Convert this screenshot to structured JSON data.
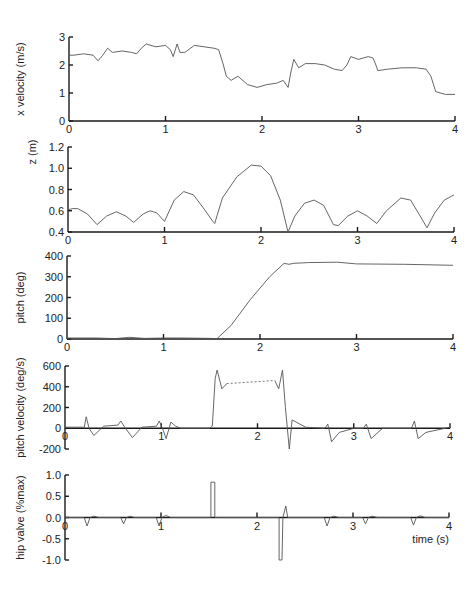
{
  "chart_data": [
    {
      "type": "line",
      "id": "xvel",
      "title": "",
      "xlabel": "",
      "ylabel": "x velocity (m/s)",
      "xlim": [
        0,
        4
      ],
      "ylim": [
        0,
        3
      ],
      "xticks": [
        0,
        1,
        2,
        3,
        4
      ],
      "yticks": [
        0,
        1,
        2,
        3
      ],
      "ytick_labels": [
        "0",
        "1",
        "2",
        "3"
      ],
      "frame": {
        "x0": 69,
        "x1": 455,
        "yTop": 37,
        "yBottom": 121,
        "xAxisAt": 0,
        "xTickLabelsBelow": true
      },
      "series": [
        {
          "name": "x velocity",
          "x": [
            0,
            0.05,
            0.15,
            0.25,
            0.3,
            0.35,
            0.4,
            0.45,
            0.55,
            0.65,
            0.7,
            0.75,
            0.8,
            0.9,
            1.0,
            1.05,
            1.08,
            1.12,
            1.15,
            1.2,
            1.3,
            1.4,
            1.5,
            1.55,
            1.6,
            1.63,
            1.68,
            1.75,
            1.85,
            1.95,
            2.05,
            2.15,
            2.22,
            2.27,
            2.3,
            2.33,
            2.38,
            2.45,
            2.55,
            2.65,
            2.75,
            2.83,
            2.88,
            2.92,
            3.0,
            3.1,
            3.15,
            3.18,
            3.2,
            3.3,
            3.45,
            3.6,
            3.7,
            3.75,
            3.8,
            3.9,
            4.0
          ],
          "values": [
            2.35,
            2.35,
            2.4,
            2.35,
            2.15,
            2.35,
            2.6,
            2.45,
            2.5,
            2.45,
            2.4,
            2.6,
            2.75,
            2.65,
            2.7,
            2.55,
            2.3,
            2.75,
            2.45,
            2.45,
            2.7,
            2.65,
            2.6,
            2.55,
            2.0,
            1.6,
            1.45,
            1.6,
            1.3,
            1.2,
            1.3,
            1.35,
            1.45,
            1.2,
            1.75,
            2.2,
            1.9,
            2.05,
            2.05,
            2.0,
            1.85,
            1.8,
            2.0,
            2.3,
            2.2,
            2.3,
            2.25,
            2.0,
            1.8,
            1.85,
            1.9,
            1.9,
            1.85,
            1.6,
            1.05,
            0.95,
            0.95
          ]
        }
      ]
    },
    {
      "type": "line",
      "id": "z",
      "xlabel": "",
      "ylabel": "z (m)",
      "xlim": [
        0,
        4
      ],
      "ylim": [
        0.4,
        1.2
      ],
      "xticks": [
        0,
        1,
        2,
        3,
        4
      ],
      "yticks": [
        0.4,
        0.6,
        0.8,
        1.0,
        1.2
      ],
      "ytick_labels": [
        "0.4",
        "0.6",
        "0.8",
        "1.0",
        "1.2"
      ],
      "frame": {
        "x0": 68,
        "x1": 454,
        "yTop": 147,
        "yBottom": 232,
        "xAxisAt": 0.4,
        "xTickLabelsBelow": true
      },
      "series": [
        {
          "name": "z",
          "x": [
            0,
            0.05,
            0.1,
            0.2,
            0.3,
            0.4,
            0.5,
            0.6,
            0.68,
            0.78,
            0.85,
            0.92,
            1.0,
            1.1,
            1.2,
            1.3,
            1.4,
            1.5,
            1.52,
            1.6,
            1.75,
            1.9,
            2.0,
            2.1,
            2.2,
            2.28,
            2.35,
            2.45,
            2.55,
            2.65,
            2.75,
            2.8,
            2.9,
            3.0,
            3.1,
            3.2,
            3.3,
            3.45,
            3.55,
            3.65,
            3.72,
            3.8,
            3.9,
            4.0
          ],
          "values": [
            0.61,
            0.62,
            0.62,
            0.57,
            0.47,
            0.55,
            0.59,
            0.55,
            0.49,
            0.57,
            0.6,
            0.58,
            0.5,
            0.7,
            0.78,
            0.75,
            0.63,
            0.5,
            0.48,
            0.72,
            0.92,
            1.03,
            1.02,
            0.93,
            0.7,
            0.4,
            0.55,
            0.67,
            0.7,
            0.65,
            0.47,
            0.46,
            0.55,
            0.6,
            0.55,
            0.48,
            0.6,
            0.72,
            0.7,
            0.55,
            0.44,
            0.58,
            0.7,
            0.75
          ]
        }
      ]
    },
    {
      "type": "line",
      "id": "pitch",
      "xlabel": "",
      "ylabel": "pitch (deg)",
      "xlim": [
        0,
        4
      ],
      "ylim": [
        0,
        400
      ],
      "xticks": [
        0,
        1,
        2,
        3,
        4
      ],
      "yticks": [
        0,
        100,
        200,
        300,
        400
      ],
      "ytick_labels": [
        "0",
        "100",
        "200",
        "300",
        "400"
      ],
      "frame": {
        "x0": 67,
        "x1": 453,
        "yTop": 256,
        "yBottom": 339,
        "xAxisAt": 0,
        "xTickLabelsBelow": true
      },
      "series": [
        {
          "name": "pitch",
          "x": [
            0,
            0.3,
            0.5,
            0.65,
            0.8,
            1.0,
            1.2,
            1.5,
            1.55,
            1.7,
            1.9,
            2.1,
            2.25,
            2.3,
            2.35,
            2.5,
            2.8,
            3.0,
            3.5,
            4.0
          ],
          "values": [
            5,
            5,
            2,
            8,
            3,
            5,
            5,
            3,
            0,
            65,
            190,
            300,
            365,
            360,
            365,
            368,
            370,
            362,
            360,
            355
          ]
        }
      ]
    },
    {
      "type": "line",
      "id": "pitchvel",
      "xlabel": "",
      "ylabel": "pitch velocity (deg/s)",
      "xlim": [
        0,
        4
      ],
      "ylim": [
        -200,
        600
      ],
      "xticks": [
        0,
        1,
        2,
        3,
        4
      ],
      "yticks": [
        -200,
        0,
        200,
        400,
        600
      ],
      "ytick_labels": [
        "-200",
        "0",
        "200",
        "400",
        "600"
      ],
      "frame": {
        "x0": 65,
        "x1": 450,
        "yTop": 366,
        "yBottom": 449,
        "xAxisAt": 0,
        "xTickLabelsBelow": true
      },
      "series": [
        {
          "name": "pitch velocity",
          "x": [
            0,
            0.2,
            0.22,
            0.25,
            0.3,
            0.4,
            0.55,
            0.58,
            0.62,
            0.7,
            0.8,
            0.95,
            0.98,
            1.02,
            1.05,
            1.1,
            1.15,
            1.2,
            1.5,
            1.53,
            1.56,
            1.58,
            1.63,
            1.68
          ],
          "values": [
            10,
            10,
            110,
            0,
            -70,
            20,
            30,
            70,
            10,
            -90,
            10,
            20,
            70,
            -20,
            -100,
            60,
            20,
            0,
            0,
            20,
            480,
            560,
            380,
            430
          ]
        },
        {
          "name": "pitch velocity (gap)",
          "style": "dotted",
          "x": [
            1.68,
            2.18
          ],
          "values": [
            430,
            460
          ]
        },
        {
          "name": "pitch velocity (cont)",
          "x": [
            2.18,
            2.22,
            2.26,
            2.29,
            2.33,
            2.36,
            2.4,
            2.5,
            2.7,
            2.73,
            2.77,
            2.85,
            3.0,
            3.1,
            3.13,
            3.18,
            3.3,
            3.6,
            3.63,
            3.67,
            3.75,
            4.0
          ],
          "values": [
            460,
            380,
            560,
            200,
            -200,
            80,
            60,
            10,
            0,
            40,
            -130,
            -40,
            0,
            0,
            40,
            -100,
            0,
            0,
            70,
            -100,
            -40,
            10
          ]
        }
      ]
    },
    {
      "type": "line",
      "id": "hipvalve",
      "xlabel": "time (s)",
      "ylabel": "hip valve (%max)",
      "xlim": [
        0,
        4
      ],
      "ylim": [
        -1.0,
        1.0
      ],
      "xticks": [
        0,
        1,
        2,
        3,
        4
      ],
      "yticks": [
        -1.0,
        -0.5,
        0.0,
        0.5,
        1.0
      ],
      "ytick_labels": [
        "-1.0",
        "-0.5",
        "0.0",
        "0.5",
        "1.0"
      ],
      "frame": {
        "x0": 65,
        "x1": 449,
        "yTop": 475,
        "yBottom": 560,
        "xAxisAt": 0,
        "xTickLabelsBelow": true
      },
      "series": [
        {
          "name": "hip valve",
          "x": [
            0,
            0.2,
            0.23,
            0.26,
            0.3,
            0.35,
            0.58,
            0.61,
            0.64,
            0.68,
            0.72,
            0.95,
            0.98,
            1.01,
            1.05,
            1.1,
            1.5,
            1.52,
            1.52,
            1.56,
            1.56,
            1.6,
            2.2,
            2.23,
            2.23,
            2.26,
            2.27,
            2.3,
            2.32,
            2.7,
            2.73,
            2.76,
            2.8,
            2.85,
            3.1,
            3.13,
            3.16,
            3.2,
            3.25,
            3.6,
            3.63,
            3.66,
            3.7,
            3.75,
            4.0
          ],
          "values": [
            0,
            0,
            -0.2,
            0,
            0.03,
            0,
            0,
            -0.15,
            0,
            0.03,
            0,
            0,
            -0.2,
            0,
            0.05,
            0,
            0,
            0,
            0.83,
            0.83,
            0,
            0,
            0,
            0,
            -1.0,
            -1.0,
            0,
            0.27,
            0,
            0,
            -0.2,
            0,
            0.03,
            0,
            0,
            -0.15,
            0,
            0.03,
            0,
            0,
            -0.18,
            0,
            0.04,
            0,
            0
          ]
        }
      ]
    }
  ]
}
